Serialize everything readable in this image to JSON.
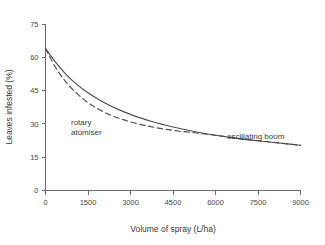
{
  "chart_data": {
    "type": "line",
    "title": "",
    "xlabel": "Volume of spray (L/ha)",
    "ylabel": "Leaves infested (%)",
    "xlim": [
      0,
      9000
    ],
    "ylim": [
      0,
      75
    ],
    "xticks": [
      0,
      1500,
      3000,
      4500,
      6000,
      7500,
      9000
    ],
    "yticks": [
      0,
      15,
      30,
      45,
      60,
      75
    ],
    "xtick_labels": [
      "0",
      "1500",
      "3000",
      "4500",
      "6000",
      "7500",
      "9000"
    ],
    "ytick_labels": [
      "0",
      "15",
      "30",
      "45",
      "60",
      "75"
    ],
    "grid": false,
    "legend": "inline-annotations",
    "line_color": "#4f4f4f",
    "axis_color": "#6d6d6d",
    "background_color": "#ffffff",
    "x": [
      0,
      375,
      750,
      1125,
      1500,
      1875,
      2250,
      2625,
      3000,
      3375,
      3750,
      4125,
      4500,
      5250,
      6000,
      6750,
      7500,
      8250,
      9000
    ],
    "series": [
      {
        "name": "oscillating boom",
        "style": "solid",
        "annotation": "oscillating boom",
        "annotation_x": 6900,
        "annotation_y": 27.5,
        "values": [
          64.0,
          57.5,
          52.0,
          47.6,
          44.0,
          41.0,
          38.4,
          36.2,
          34.3,
          32.6,
          31.1,
          29.8,
          28.6,
          26.6,
          24.9,
          23.5,
          22.4,
          21.4,
          20.4
        ]
      },
      {
        "name": "rotary atomiser",
        "style": "dashed",
        "annotation": "rotary\natomiser",
        "annotation_line_1": "rotary",
        "annotation_line_2": "atomiser",
        "annotation_x": 1600,
        "annotation_y": 30.5,
        "values": [
          64.0,
          55.0,
          48.5,
          43.5,
          39.6,
          36.6,
          34.2,
          32.4,
          30.9,
          29.7,
          28.7,
          27.8,
          27.1,
          26.0,
          24.9,
          23.5,
          22.4,
          21.4,
          20.4
        ]
      }
    ]
  }
}
